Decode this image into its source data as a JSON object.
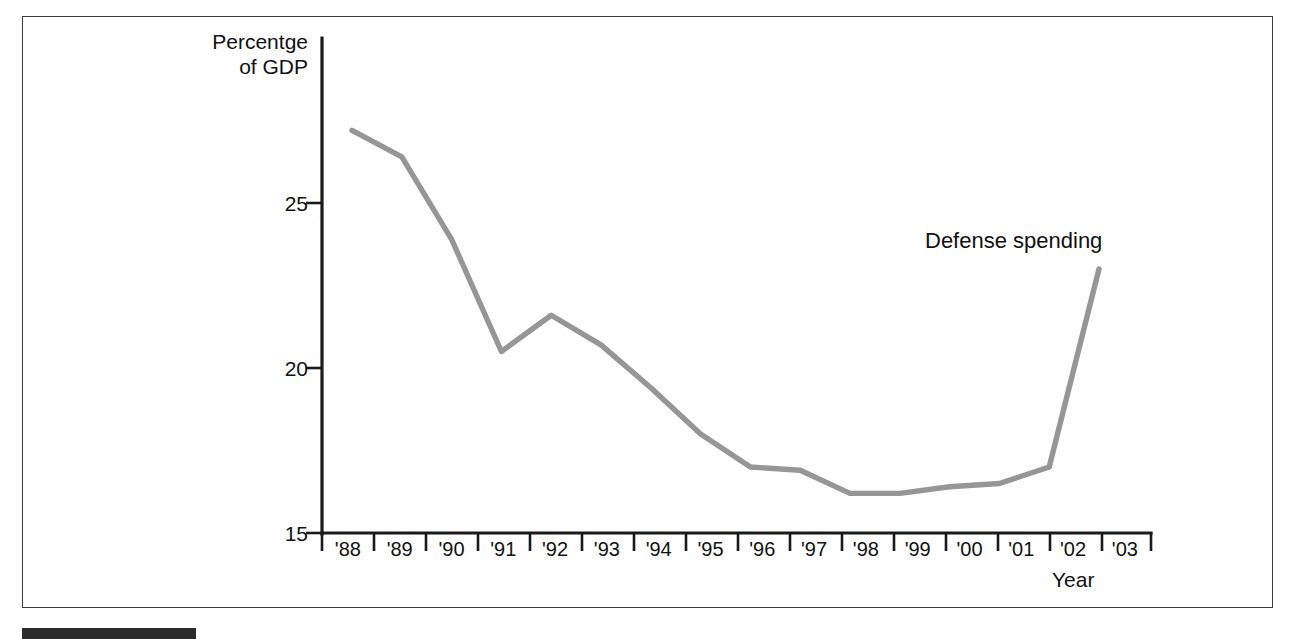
{
  "chart_data": {
    "type": "line",
    "title": "",
    "subtitle": "",
    "xlabel": "Year",
    "ylabel": "Percentge of GDP",
    "ylabel_lines": [
      "Percentge",
      "of GDP"
    ],
    "categories": [
      "'88",
      "'89",
      "'90",
      "'91",
      "'92",
      "'93",
      "'94",
      "'95",
      "'96",
      "'97",
      "'98",
      "'99",
      "'00",
      "'01",
      "'02",
      "'03"
    ],
    "series": [
      {
        "name": "Defense spending",
        "values": [
          27.2,
          26.4,
          23.9,
          20.5,
          21.6,
          20.7,
          19.4,
          18.0,
          17.0,
          16.9,
          16.2,
          16.2,
          16.4,
          16.5,
          17.0,
          23.0
        ],
        "color": "#969696"
      }
    ],
    "ylim": [
      15,
      28.5
    ],
    "yticks": [
      15,
      20,
      25
    ],
    "ytick_labels": [
      "15",
      "20",
      "25"
    ],
    "xlim": [
      "'88",
      "'03"
    ],
    "grid": false,
    "legend": "inline-annotation",
    "legend_position": "top-right",
    "annotations": [
      {
        "text": "Defense spending",
        "near": "'03"
      }
    ]
  },
  "figure": {
    "background_color": "#ffffff",
    "frame_color": "#3a3a3a",
    "axis_color": "#1a1a1a",
    "text_color": "#111111",
    "caption_bar_color": "#2b2b2b"
  }
}
